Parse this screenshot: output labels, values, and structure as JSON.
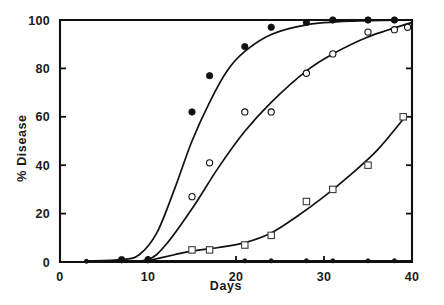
{
  "chart_data": {
    "type": "scatter",
    "title": "",
    "xlabel": "Days",
    "ylabel": "% Disease",
    "xlim": [
      0,
      40
    ],
    "ylim": [
      0,
      100
    ],
    "xticks": [
      0,
      10,
      20,
      30,
      40
    ],
    "xtick_labels": [
      "0",
      "10",
      "20",
      "30",
      "40"
    ],
    "yticks": [
      0,
      20,
      40,
      60,
      80,
      100
    ],
    "ytick_labels": [
      "0",
      "20",
      "40",
      "60",
      "80",
      "100"
    ],
    "grid": false,
    "legend": "none",
    "series": [
      {
        "name": "filled-circles",
        "marker": "filled-circle",
        "points": [
          {
            "x": 7,
            "y": 1
          },
          {
            "x": 10,
            "y": 1
          },
          {
            "x": 15,
            "y": 62
          },
          {
            "x": 17,
            "y": 77
          },
          {
            "x": 21,
            "y": 89
          },
          {
            "x": 24,
            "y": 97
          },
          {
            "x": 28,
            "y": 99
          },
          {
            "x": 31,
            "y": 100
          },
          {
            "x": 35,
            "y": 100
          },
          {
            "x": 38,
            "y": 100
          }
        ],
        "curve": [
          {
            "x": 3,
            "y": 0.4
          },
          {
            "x": 7,
            "y": 1
          },
          {
            "x": 9,
            "y": 3
          },
          {
            "x": 11,
            "y": 12
          },
          {
            "x": 13,
            "y": 30
          },
          {
            "x": 15,
            "y": 50
          },
          {
            "x": 17,
            "y": 66
          },
          {
            "x": 19,
            "y": 79
          },
          {
            "x": 21,
            "y": 87
          },
          {
            "x": 24,
            "y": 94
          },
          {
            "x": 28,
            "y": 98
          },
          {
            "x": 33,
            "y": 99.5
          },
          {
            "x": 40,
            "y": 100
          }
        ]
      },
      {
        "name": "open-circles",
        "marker": "open-circle",
        "points": [
          {
            "x": 15,
            "y": 27
          },
          {
            "x": 17,
            "y": 41
          },
          {
            "x": 21,
            "y": 62
          },
          {
            "x": 24,
            "y": 62
          },
          {
            "x": 28,
            "y": 78
          },
          {
            "x": 31,
            "y": 86
          },
          {
            "x": 35,
            "y": 95
          },
          {
            "x": 38,
            "y": 96
          },
          {
            "x": 39.5,
            "y": 97
          }
        ],
        "curve": [
          {
            "x": 7,
            "y": 0.3
          },
          {
            "x": 10,
            "y": 1
          },
          {
            "x": 12,
            "y": 7
          },
          {
            "x": 15,
            "y": 22
          },
          {
            "x": 18,
            "y": 39
          },
          {
            "x": 21,
            "y": 54
          },
          {
            "x": 24,
            "y": 66
          },
          {
            "x": 28,
            "y": 79
          },
          {
            "x": 31,
            "y": 86
          },
          {
            "x": 35,
            "y": 93
          },
          {
            "x": 40,
            "y": 99
          }
        ]
      },
      {
        "name": "open-squares",
        "marker": "open-square",
        "points": [
          {
            "x": 15,
            "y": 5
          },
          {
            "x": 17,
            "y": 5
          },
          {
            "x": 21,
            "y": 7
          },
          {
            "x": 24,
            "y": 11
          },
          {
            "x": 28,
            "y": 25
          },
          {
            "x": 31,
            "y": 30
          },
          {
            "x": 35,
            "y": 40
          },
          {
            "x": 39,
            "y": 60
          }
        ],
        "curve": [
          {
            "x": 10,
            "y": 0.5
          },
          {
            "x": 13,
            "y": 3
          },
          {
            "x": 15,
            "y": 4.5
          },
          {
            "x": 18,
            "y": 6
          },
          {
            "x": 21,
            "y": 8
          },
          {
            "x": 24,
            "y": 12
          },
          {
            "x": 27,
            "y": 19
          },
          {
            "x": 30,
            "y": 27
          },
          {
            "x": 33,
            "y": 36
          },
          {
            "x": 36,
            "y": 46
          },
          {
            "x": 39,
            "y": 59
          }
        ]
      },
      {
        "name": "baseline-flat",
        "marker": "filled-circle-small",
        "points": [
          {
            "x": 3,
            "y": 0.3
          },
          {
            "x": 7,
            "y": 0.5
          },
          {
            "x": 10,
            "y": 0.5
          },
          {
            "x": 21,
            "y": 0.5
          },
          {
            "x": 24,
            "y": 0.5
          },
          {
            "x": 28,
            "y": 0.5
          },
          {
            "x": 31,
            "y": 0.5
          },
          {
            "x": 35,
            "y": 0.5
          },
          {
            "x": 38,
            "y": 0.5
          }
        ],
        "curve": [
          {
            "x": 3,
            "y": 0.5
          },
          {
            "x": 40,
            "y": 0.5
          }
        ]
      }
    ]
  }
}
